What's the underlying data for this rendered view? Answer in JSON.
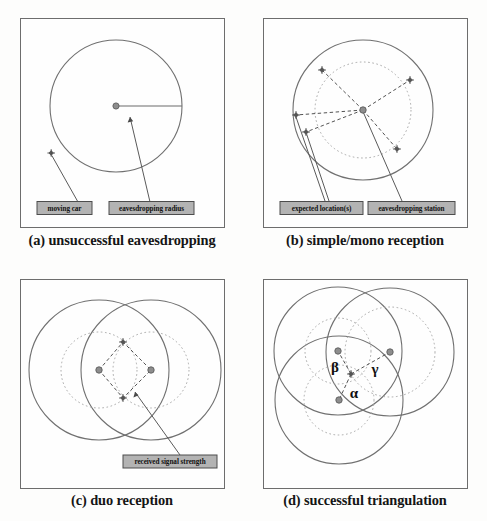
{
  "figure": {
    "background_color": "#fdfdfc",
    "panel_border_color": "#6d6d6d",
    "solid_circle_color": "#707070",
    "dotted_circle_color": "#a8a8a8",
    "dashed_line_color": "#4a4a4a",
    "leader_line_color": "#5a5a5a",
    "label_box_fill": "#b3b3b3",
    "label_box_border": "#4d4d4d",
    "marker_car_color": "#6b6b6b",
    "marker_station_color": "#7a7a7a"
  },
  "panels": [
    {
      "id": "a",
      "caption": "(a) unsuccessful eavesdropping",
      "labels": [
        {
          "key": "moving_car",
          "text": "moving car"
        },
        {
          "key": "eavesdropping_radius",
          "text": "eavesdropping radius"
        }
      ],
      "markers": {
        "stations": 1,
        "cars": 1
      },
      "circles": {
        "solid": 1,
        "dotted": 0
      }
    },
    {
      "id": "b",
      "caption": "(b) simple/mono reception",
      "labels": [
        {
          "key": "expected_locations",
          "text": "expected location(s)"
        },
        {
          "key": "eavesdropping_station",
          "text": "eavesdropping station"
        }
      ],
      "markers": {
        "stations": 1,
        "cars": 5
      },
      "circles": {
        "solid": 1,
        "dotted": 1
      }
    },
    {
      "id": "c",
      "caption": "(c) duo reception",
      "labels": [
        {
          "key": "received_signal_strength",
          "text": "received signal strength"
        }
      ],
      "markers": {
        "stations": 2,
        "cars": 2
      },
      "circles": {
        "solid": 2,
        "dotted": 2
      }
    },
    {
      "id": "d",
      "caption": "(d) successful triangulation",
      "labels": [],
      "annotations": [
        {
          "key": "alpha",
          "text": "α"
        },
        {
          "key": "beta",
          "text": "β"
        },
        {
          "key": "gamma",
          "text": "γ"
        }
      ],
      "markers": {
        "stations": 3,
        "cars": 1
      },
      "circles": {
        "solid": 3,
        "dotted": 3
      }
    }
  ]
}
